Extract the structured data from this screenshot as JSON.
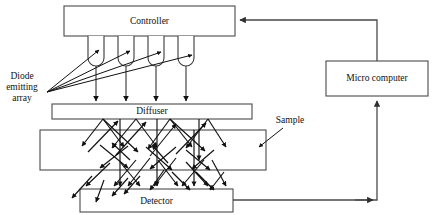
{
  "figure": {
    "width": 435,
    "height": 215,
    "background_color": "#ffffff",
    "line_color": "#4a4a4a",
    "ray_color": "#111111",
    "text_color": "#111111"
  },
  "blocks": [
    {
      "id": "controller",
      "label": "Controller",
      "x": 64,
      "y": 6,
      "width": 171,
      "height": 30,
      "label_x": 149.5,
      "label_y": 21
    },
    {
      "id": "micro-computer",
      "label": "Micro computer",
      "x": 326,
      "y": 61,
      "width": 102,
      "height": 35,
      "label_x": 377,
      "label_y": 78.5
    },
    {
      "id": "diffuser",
      "label": "Diffuser",
      "x": 52,
      "y": 104,
      "width": 200,
      "height": 15,
      "label_x": 152,
      "label_y": 111.5
    },
    {
      "id": "sample",
      "label": "",
      "x": 40,
      "y": 130,
      "width": 226,
      "height": 40,
      "label_x": 153,
      "label_y": 150
    },
    {
      "id": "detector",
      "label": "Detector",
      "x": 80,
      "y": 189,
      "width": 153,
      "height": 23,
      "label_x": 156.5,
      "label_y": 200.5
    }
  ],
  "free_labels": [
    {
      "id": "diode-emitting-array",
      "lines": [
        "Diode",
        "emitting",
        "array"
      ],
      "x": 22,
      "y": 76,
      "line_height": 11
    },
    {
      "id": "sample-label",
      "lines": [
        "Sample"
      ],
      "x": 288,
      "y": 123,
      "line_height": 11
    }
  ],
  "leds": [
    {
      "id": "led-1",
      "x": 88,
      "top": 36,
      "width": 16,
      "height": 30
    },
    {
      "id": "led-2",
      "x": 118,
      "top": 36,
      "width": 16,
      "height": 30
    },
    {
      "id": "led-3",
      "x": 148,
      "top": 36,
      "width": 16,
      "height": 30
    },
    {
      "id": "led-4",
      "x": 178,
      "top": 36,
      "width": 16,
      "height": 30
    }
  ],
  "led_drop_arrows": [
    {
      "id": "led-drop-1",
      "x": 96,
      "y1": 66,
      "y2": 102
    },
    {
      "id": "led-drop-2",
      "x": 126,
      "y1": 66,
      "y2": 102
    },
    {
      "id": "led-drop-3",
      "x": 156,
      "y1": 66,
      "y2": 102
    },
    {
      "id": "led-drop-4",
      "x": 186,
      "y1": 66,
      "y2": 102
    }
  ],
  "pointer_lines": [
    {
      "id": "pointer-led-1",
      "x1": 47,
      "y1": 92,
      "x2": 100,
      "y2": 50
    },
    {
      "id": "pointer-led-2",
      "x1": 47,
      "y1": 92,
      "x2": 131,
      "y2": 51
    },
    {
      "id": "pointer-led-3",
      "x1": 47,
      "y1": 92,
      "x2": 162,
      "y2": 52
    },
    {
      "id": "pointer-led-4",
      "x1": 47,
      "y1": 92,
      "x2": 193,
      "y2": 55
    }
  ],
  "sample_pointer": {
    "id": "sample-pointer",
    "x1": 283,
    "y1": 128,
    "x2": 258,
    "y2": 148
  },
  "connections": [
    {
      "id": "micro-to-controller",
      "path": "M 377 61 L 377 20 L 240 20",
      "arrow_at": "end",
      "arrow_x": 236,
      "arrow_y": 20,
      "arrow_dir": "left"
    },
    {
      "id": "detector-to-micro",
      "path": "M 233 200 L 377 200 L 377 100",
      "arrow_at": "middle-and-end",
      "arrow_x": 377,
      "arrow_y": 97,
      "arrow_dir": "up",
      "mid_arrow_x": 374,
      "mid_arrow_y": 200,
      "mid_arrow_dir": "right"
    }
  ],
  "scatter_rays": {
    "description": "Zig-zag multiple-scattering light paths between the diffuser, sample slab and detector",
    "count": 44
  }
}
